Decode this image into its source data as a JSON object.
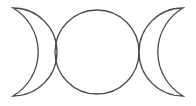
{
  "symbol": {
    "name": "Triple Moon",
    "parts": [
      {
        "id": "waxing-crescent",
        "label": "Waxing crescent"
      },
      {
        "id": "full-moon",
        "label": "Full moon"
      },
      {
        "id": "waning-crescent",
        "label": "Waning crescent"
      }
    ]
  },
  "colors": {
    "stroke": "#4a4a4a",
    "background": "#ffffff"
  }
}
